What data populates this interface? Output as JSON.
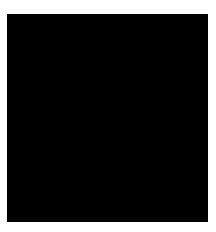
{
  "figure": {
    "page_labels": [
      "1",
      "2"
    ],
    "panel": {
      "background": "#000000",
      "line_color": "#e8e8e8"
    },
    "top_structure": {
      "description": "wireframe hyperbolic paraboloid shell, apex at top",
      "apex": [
        108,
        22
      ],
      "base_left": [
        18,
        130
      ],
      "base_right": [
        198,
        130
      ],
      "grid_rows": 11,
      "grid_cols": 16
    },
    "bottom_structure": {
      "description": "wireframe shell with two raised corners and a central arch",
      "left_peak": [
        55,
        163
      ],
      "right_peak": [
        170,
        160
      ],
      "arch_left": [
        28,
        222
      ],
      "arch_top": [
        108,
        196
      ],
      "arch_right": [
        190,
        222
      ]
    }
  }
}
